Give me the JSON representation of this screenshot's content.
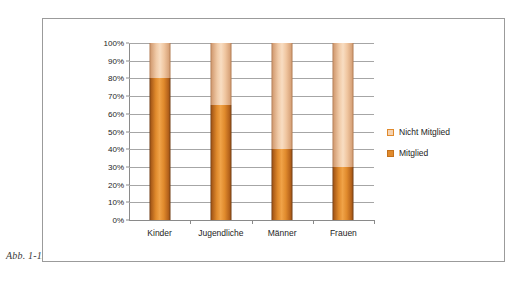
{
  "figure": {
    "caption": "Abb. 1-12"
  },
  "chart_data": {
    "type": "bar",
    "subtype": "stacked-100-percent",
    "title": "",
    "xlabel": "",
    "ylabel": "",
    "categories": [
      "Kinder",
      "Jugendliche",
      "Männer",
      "Frauen"
    ],
    "series": [
      {
        "name": "Mitglied",
        "values": [
          80,
          65,
          40,
          30
        ],
        "color": "#E08A2C"
      },
      {
        "name": "Nicht Mitglied",
        "values": [
          20,
          35,
          60,
          70
        ],
        "color": "#F5D3B2"
      }
    ],
    "ylim": [
      0,
      100
    ],
    "ytick_labels": [
      "100%",
      "90%",
      "80%",
      "70%",
      "60%",
      "50%",
      "40%",
      "30%",
      "20%",
      "10%",
      "0%"
    ],
    "ytick_values": [
      100,
      90,
      80,
      70,
      60,
      50,
      40,
      30,
      20,
      10,
      0
    ],
    "grid": true,
    "legend_position": "right"
  },
  "legend": {
    "items": [
      {
        "label": "Nicht Mitglied",
        "swatch": "legend-swatch-nicht-mitglied"
      },
      {
        "label": "Mitglied",
        "swatch": "legend-swatch-mitglied"
      }
    ]
  },
  "colors": {
    "member": "#E08A2C",
    "nonmember": "#F5D3B2",
    "grid": "#A6A6A6",
    "axis": "#8A8A8A",
    "frame": "#9B9B9B",
    "text": "#1D1D1D"
  }
}
